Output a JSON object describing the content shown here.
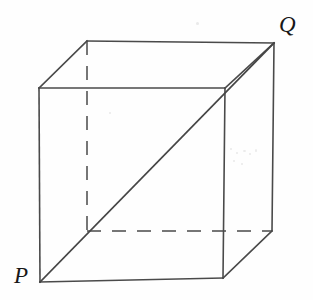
{
  "figure": {
    "type": "geometry-diagram",
    "background_color": "#fefefe",
    "stroke_color": "#4a4a4a",
    "label_color": "#171717",
    "canvas": {
      "width": 313,
      "height": 300
    }
  },
  "labels": {
    "p": "P",
    "q": "Q"
  },
  "geometry": {
    "vertices": {
      "front_top_left": {
        "x": 39,
        "y": 88
      },
      "front_top_right": {
        "x": 225,
        "y": 88
      },
      "front_bottom_right": {
        "x": 223,
        "y": 278
      },
      "front_bottom_left": {
        "x": 40,
        "y": 282
      },
      "back_top_left": {
        "x": 87,
        "y": 41
      },
      "back_top_right": {
        "x": 274,
        "y": 43
      },
      "back_bottom_right": {
        "x": 272,
        "y": 231
      },
      "back_bottom_left": {
        "x": 87,
        "y": 231
      }
    },
    "solid_edges": [
      {
        "name": "front-top",
        "x1": 39,
        "y1": 88,
        "x2": 225,
        "y2": 88
      },
      {
        "name": "front-right",
        "x1": 225,
        "y1": 88,
        "x2": 223,
        "y2": 278
      },
      {
        "name": "front-bottom",
        "x1": 223,
        "y1": 278,
        "x2": 40,
        "y2": 282
      },
      {
        "name": "front-left",
        "x1": 40,
        "y1": 282,
        "x2": 39,
        "y2": 88
      },
      {
        "name": "back-top",
        "x1": 87,
        "y1": 41,
        "x2": 274,
        "y2": 43
      },
      {
        "name": "back-right",
        "x1": 274,
        "y1": 43,
        "x2": 272,
        "y2": 231
      },
      {
        "name": "top-left-connect",
        "x1": 39,
        "y1": 88,
        "x2": 87,
        "y2": 41
      },
      {
        "name": "top-right-connect",
        "x1": 225,
        "y1": 88,
        "x2": 274,
        "y2": 43
      },
      {
        "name": "bottom-right-connect",
        "x1": 223,
        "y1": 278,
        "x2": 272,
        "y2": 231
      }
    ],
    "dashed_edges": [
      {
        "name": "hidden-back-left-vertical",
        "x1": 87,
        "y1": 41,
        "x2": 87,
        "y2": 231
      },
      {
        "name": "hidden-back-bottom-horizontal",
        "x1": 87,
        "y1": 231,
        "x2": 272,
        "y2": 231
      }
    ],
    "diagonal": {
      "name": "space-diagonal-PQ",
      "from": "P",
      "to": "Q",
      "x1": 40,
      "y1": 282,
      "x2": 274,
      "y2": 43
    }
  },
  "artifacts": [
    {
      "x": 196,
      "y": 22,
      "w": 3,
      "h": 3
    },
    {
      "x": 230,
      "y": 148,
      "w": 2,
      "h": 2
    },
    {
      "x": 236,
      "y": 152,
      "w": 2,
      "h": 2
    },
    {
      "x": 243,
      "y": 150,
      "w": 3,
      "h": 2
    },
    {
      "x": 249,
      "y": 153,
      "w": 2,
      "h": 2
    },
    {
      "x": 255,
      "y": 149,
      "w": 2,
      "h": 3
    },
    {
      "x": 233,
      "y": 160,
      "w": 2,
      "h": 2
    },
    {
      "x": 241,
      "y": 163,
      "w": 2,
      "h": 2
    },
    {
      "x": 109,
      "y": 112,
      "w": 2,
      "h": 2
    }
  ]
}
